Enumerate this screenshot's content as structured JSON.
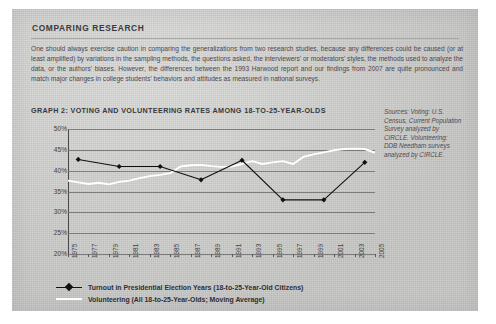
{
  "page": {
    "heading": "COMPARING RESEARCH",
    "paragraph": "One should always exercise caution in comparing the generalizations from two research studies, because any differences could be caused (or at least amplified) by variations in the sampling methods, the questions asked, the interviewers' or moderators' styles, the methods used to analyze the data, or the authors' biases.  However, the differences between the 1993 Harwood report and our findings from 2007 are quite pronounced and match major changes in college students' behaviors and attitudes as measured in national surveys."
  },
  "chart_panel": {
    "title": "GRAPH 2: VOTING AND VOLUNTEERING RATES AMONG 18-TO-25-YEAR-OLDS",
    "sources": "Sources: Voting: U.S. Census, Current Population Survey analyzed by CIRCLE. Volunteering: DDB Needham surveys analyzed by CIRCLE."
  },
  "legend": {
    "items": [
      {
        "label": "Turnout in Presidential Election Years (18-to-25-Year-Old Citizens)",
        "marker": "line-with-diamond",
        "color": "#111111"
      },
      {
        "label": "Volunteering (All 18-to-25-Year-Olds; Moving Average)",
        "marker": "line",
        "color": "#ffffff"
      }
    ]
  },
  "chart_data": {
    "type": "line",
    "title": "GRAPH 2: VOTING AND VOLUNTEERING RATES AMONG 18-TO-25-YEAR-OLDS",
    "xlabel": "",
    "ylabel": "",
    "ylim": [
      20,
      50
    ],
    "yticks": [
      20,
      25,
      30,
      35,
      40,
      45,
      50
    ],
    "ytick_labels": [
      "20%",
      "25%",
      "30%",
      "35%",
      "40%",
      "45%",
      "50%"
    ],
    "xlim": [
      1975,
      2005
    ],
    "xticks": [
      1975,
      1977,
      1979,
      1981,
      1983,
      1985,
      1987,
      1989,
      1991,
      1993,
      1995,
      1997,
      1999,
      2001,
      2003,
      2005
    ],
    "xtick_labels": [
      "1975",
      "1977",
      "1979",
      "1981",
      "1983",
      "1985",
      "1987",
      "1989",
      "1991",
      "1993",
      "1995",
      "1997",
      "1999",
      "2001",
      "2003",
      "2005"
    ],
    "grid": true,
    "legend_position": "below",
    "series": [
      {
        "name": "Turnout in Presidential Election Years (18-to-25-Year-Old Citizens)",
        "color": "#111111",
        "marker": "diamond",
        "x": [
          1976,
          1980,
          1984,
          1988,
          1992,
          1996,
          2000,
          2004
        ],
        "values": [
          42.7,
          41.0,
          41.0,
          37.8,
          42.5,
          33.0,
          33.0,
          42.0
        ]
      },
      {
        "name": "Volunteering (All 18-to-25-Year-Olds; Moving Average)",
        "color": "#ffffff",
        "marker": "none",
        "x": [
          1975,
          1976,
          1977,
          1978,
          1979,
          1980,
          1981,
          1982,
          1983,
          1984,
          1985,
          1986,
          1987,
          1988,
          1989,
          1990,
          1991,
          1992,
          1993,
          1994,
          1995,
          1996,
          1997,
          1998,
          1999,
          2000,
          2001,
          2002,
          2003,
          2004,
          2005
        ],
        "values": [
          37.6,
          37.2,
          36.8,
          37.1,
          36.7,
          37.3,
          37.6,
          38.2,
          38.7,
          39.0,
          39.4,
          41.0,
          41.3,
          41.4,
          41.1,
          40.9,
          41.0,
          41.6,
          42.3,
          41.6,
          42.0,
          42.3,
          41.6,
          43.3,
          43.9,
          44.4,
          44.9,
          45.2,
          45.3,
          45.2,
          44.3
        ]
      }
    ]
  }
}
